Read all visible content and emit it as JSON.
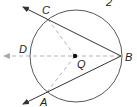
{
  "diagram": {
    "type": "circle-geometry",
    "corner_label": "2",
    "circle": {
      "center": "Q"
    },
    "points": {
      "A": "A",
      "B": "B",
      "C": "C",
      "D": "D",
      "Q": "Q"
    },
    "segments": [
      {
        "name": "ray BC",
        "style": "solid",
        "arrow": true
      },
      {
        "name": "ray BA",
        "style": "solid",
        "arrow": true
      },
      {
        "name": "ray BD",
        "style": "dashed",
        "arrow": true
      },
      {
        "name": "QC",
        "style": "dashed"
      },
      {
        "name": "QA",
        "style": "dashed"
      }
    ],
    "colors": {
      "solid": "#333333",
      "dashed": "#aaaaaa"
    }
  }
}
